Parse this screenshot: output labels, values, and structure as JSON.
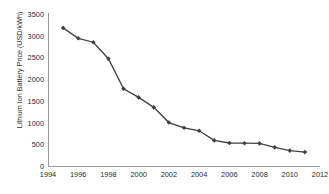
{
  "chart_data": {
    "type": "line",
    "title": "",
    "xlabel": "",
    "ylabel": "Lithium Ion Battery Price (USD/kWh)",
    "xlim": [
      1994,
      2012
    ],
    "ylim": [
      0,
      3500
    ],
    "xticks": [
      1994,
      1996,
      1998,
      2000,
      2002,
      2004,
      2006,
      2008,
      2010,
      2012
    ],
    "yticks": [
      0,
      500,
      1000,
      1500,
      2000,
      2500,
      3000,
      3500
    ],
    "grid": false,
    "legend": false,
    "marker": "diamond",
    "line_color": "#404040",
    "marker_color": "#404040",
    "x": [
      1995,
      1996,
      1997,
      1998,
      1999,
      2000,
      2001,
      2002,
      2003,
      2004,
      2005,
      2006,
      2007,
      2008,
      2009,
      2010,
      2011
    ],
    "values": [
      3180,
      2940,
      2850,
      2470,
      1780,
      1580,
      1350,
      1000,
      880,
      810,
      590,
      530,
      525,
      520,
      430,
      355,
      320
    ],
    "series": [
      {
        "name": "Lithium Ion Battery Price",
        "values": [
          3180,
          2940,
          2850,
          2470,
          1780,
          1580,
          1350,
          1000,
          880,
          810,
          590,
          530,
          525,
          520,
          430,
          355,
          320
        ]
      }
    ]
  }
}
